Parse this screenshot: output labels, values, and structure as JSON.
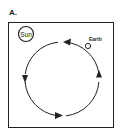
{
  "figure": {
    "label": "A.",
    "sun_label": "Sun",
    "earth_label": "Earth",
    "orbit_direction": "counterclockwise",
    "colors": {
      "stroke": "#222222",
      "background": "#ffffff"
    }
  }
}
